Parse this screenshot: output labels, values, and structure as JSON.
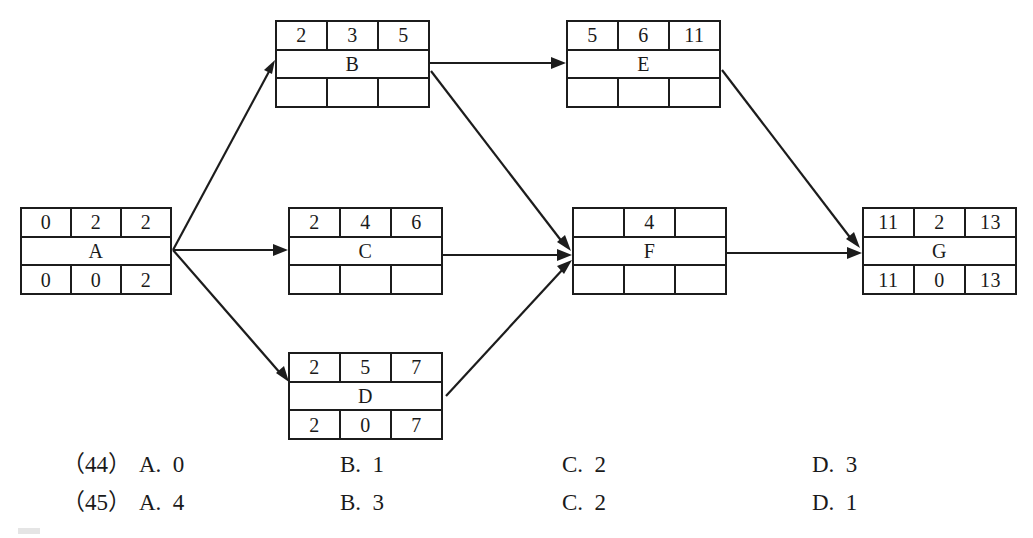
{
  "diagram": {
    "type": "activity-on-node-network",
    "nodes": [
      {
        "id": "A",
        "label": "A",
        "top": [
          "0",
          "2",
          "2"
        ],
        "bottom": [
          "0",
          "0",
          "2"
        ],
        "x": 20,
        "y": 207,
        "w": 152,
        "h": 88
      },
      {
        "id": "B",
        "label": "B",
        "top": [
          "2",
          "3",
          "5"
        ],
        "bottom": [
          "",
          "",
          ""
        ],
        "x": 275,
        "y": 20,
        "w": 155,
        "h": 88
      },
      {
        "id": "C",
        "label": "C",
        "top": [
          "2",
          "4",
          "6"
        ],
        "bottom": [
          "",
          "",
          ""
        ],
        "x": 288,
        "y": 207,
        "w": 155,
        "h": 88
      },
      {
        "id": "D",
        "label": "D",
        "top": [
          "2",
          "5",
          "7"
        ],
        "bottom": [
          "2",
          "0",
          "7"
        ],
        "x": 288,
        "y": 352,
        "w": 155,
        "h": 88
      },
      {
        "id": "E",
        "label": "E",
        "top": [
          "5",
          "6",
          "11"
        ],
        "bottom": [
          "",
          "",
          ""
        ],
        "x": 566,
        "y": 20,
        "w": 155,
        "h": 88
      },
      {
        "id": "F",
        "label": "F",
        "top": [
          "",
          "4",
          ""
        ],
        "bottom": [
          "",
          "",
          ""
        ],
        "x": 572,
        "y": 207,
        "w": 155,
        "h": 88
      },
      {
        "id": "G",
        "label": "G",
        "top": [
          "11",
          "2",
          "13"
        ],
        "bottom": [
          "11",
          "0",
          "13"
        ],
        "x": 862,
        "y": 207,
        "w": 155,
        "h": 88
      }
    ],
    "edges": [
      {
        "from": "A",
        "to": "B"
      },
      {
        "from": "A",
        "to": "C"
      },
      {
        "from": "A",
        "to": "D"
      },
      {
        "from": "B",
        "to": "E"
      },
      {
        "from": "B",
        "to": "F"
      },
      {
        "from": "C",
        "to": "F"
      },
      {
        "from": "D",
        "to": "F"
      },
      {
        "from": "E",
        "to": "G"
      },
      {
        "from": "F",
        "to": "G"
      }
    ],
    "line_color": "#1c1c1c"
  },
  "answers": {
    "rows": [
      {
        "number": "（44）",
        "a": "A.  0",
        "b": "B.  1",
        "c": "C.  2",
        "d": "D.  3"
      },
      {
        "number": "（45）",
        "a": "A.  4",
        "b": "B.  3",
        "c": "C.  2",
        "d": "D.  1"
      }
    ]
  }
}
